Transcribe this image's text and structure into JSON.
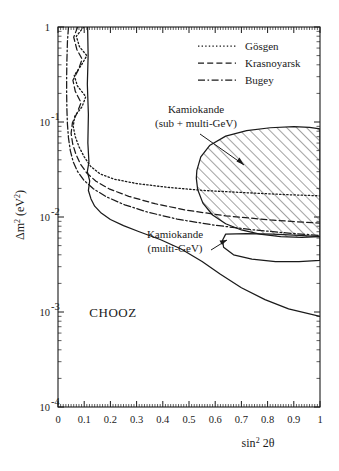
{
  "figure": {
    "background_color": "#ffffff",
    "line_color": "#1a1a1a"
  },
  "chart_data": {
    "type": "line",
    "title": "",
    "xlabel": "sin² 2θ",
    "ylabel": "Δm² (eV²)",
    "xscale": "linear",
    "yscale": "log",
    "xlim": [
      0,
      1
    ],
    "ylim": [
      0.0001,
      1
    ],
    "grid": false,
    "legend_position": "upper-right-inside",
    "xticks": [
      "0",
      "0.1",
      "0.2",
      "0.3",
      "0.4",
      "0.5",
      "0.6",
      "0.7",
      "0.8",
      "0.9",
      "1"
    ],
    "xtick_values": [
      0,
      0.1,
      0.2,
      0.3,
      0.4,
      0.5,
      0.6,
      0.7,
      0.8,
      0.9,
      1
    ],
    "yticks": [
      "1",
      "10 -1",
      "10 -2",
      "10 -3",
      "10 -4"
    ],
    "ytick_values": [
      1,
      0.1,
      0.01,
      0.001,
      0.0001
    ],
    "ytick_mantissa": [
      "1",
      "10",
      "10",
      "10",
      "10"
    ],
    "ytick_exponent": [
      "",
      "-1",
      "-2",
      "-3",
      "-4"
    ],
    "legend": [
      {
        "name": "Gösgen",
        "style": "dotted"
      },
      {
        "name": "Krasnoyarsk",
        "style": "dashed"
      },
      {
        "name": "Bugey",
        "style": "dash-dot"
      }
    ],
    "annotations": [
      {
        "id": "kamiokande-sub-multi",
        "line1": "Kamiokande",
        "line2": "(sub + multi-GeV)",
        "has_arrow": true
      },
      {
        "id": "kamiokande-multi",
        "line1": "Kamiokande",
        "line2": "(multi-GeV)",
        "has_arrow": true
      },
      {
        "id": "chooz",
        "line1": "CHOOZ",
        "line2": "",
        "has_arrow": false
      }
    ],
    "series": [
      {
        "name": "CHOOZ",
        "style": "solid",
        "description": "CHOOZ excluded-region boundary: near-vertical at sin²2θ≈0.115 from Δm²=1 down to ~3e-2, then sweeping right and down to Δm²≈9e-4 at sin²2θ=1",
        "points": [
          [
            0.113,
            1.0
          ],
          [
            0.115,
            0.5
          ],
          [
            0.112,
            0.25
          ],
          [
            0.116,
            0.12
          ],
          [
            0.114,
            0.06
          ],
          [
            0.118,
            0.038
          ],
          [
            0.112,
            0.03
          ],
          [
            0.121,
            0.024
          ],
          [
            0.116,
            0.019
          ],
          [
            0.126,
            0.0155
          ],
          [
            0.14,
            0.013
          ],
          [
            0.165,
            0.011
          ],
          [
            0.2,
            0.0094
          ],
          [
            0.25,
            0.0081
          ],
          [
            0.31,
            0.007
          ],
          [
            0.39,
            0.0058
          ],
          [
            0.47,
            0.0046
          ],
          [
            0.55,
            0.0034
          ],
          [
            0.62,
            0.0025
          ],
          [
            0.7,
            0.0018
          ],
          [
            0.79,
            0.00135
          ],
          [
            0.88,
            0.00108
          ],
          [
            1.0,
            0.0009
          ]
        ]
      },
      {
        "name": "Gösgen",
        "style": "dotted",
        "description": "Reactor exclusion curve, oscillatory above Δm²~0.06, bending right toward sin²2θ=1 near Δm²~2e-2",
        "points": [
          [
            0.098,
            1.0
          ],
          [
            0.07,
            0.8
          ],
          [
            0.082,
            0.62
          ],
          [
            0.11,
            0.5
          ],
          [
            0.09,
            0.4
          ],
          [
            0.062,
            0.31
          ],
          [
            0.074,
            0.24
          ],
          [
            0.106,
            0.185
          ],
          [
            0.092,
            0.145
          ],
          [
            0.064,
            0.115
          ],
          [
            0.058,
            0.09
          ],
          [
            0.066,
            0.07
          ],
          [
            0.08,
            0.055
          ],
          [
            0.1,
            0.043
          ],
          [
            0.125,
            0.034
          ],
          [
            0.16,
            0.0285
          ],
          [
            0.215,
            0.025
          ],
          [
            0.3,
            0.0225
          ],
          [
            0.42,
            0.0205
          ],
          [
            0.56,
            0.019
          ],
          [
            0.72,
            0.018
          ],
          [
            0.87,
            0.0172
          ],
          [
            1.0,
            0.0167
          ]
        ]
      },
      {
        "name": "Krasnoyarsk",
        "style": "dashed",
        "description": "Reactor exclusion curve, oscillatory near top, bending right and dropping below Gösgen at large mixing",
        "points": [
          [
            0.075,
            1.0
          ],
          [
            0.06,
            0.78
          ],
          [
            0.072,
            0.58
          ],
          [
            0.092,
            0.46
          ],
          [
            0.078,
            0.355
          ],
          [
            0.057,
            0.275
          ],
          [
            0.066,
            0.21
          ],
          [
            0.088,
            0.16
          ],
          [
            0.073,
            0.125
          ],
          [
            0.055,
            0.098
          ],
          [
            0.05,
            0.076
          ],
          [
            0.056,
            0.059
          ],
          [
            0.068,
            0.046
          ],
          [
            0.086,
            0.036
          ],
          [
            0.11,
            0.029
          ],
          [
            0.145,
            0.0238
          ],
          [
            0.195,
            0.0198
          ],
          [
            0.27,
            0.0165
          ],
          [
            0.37,
            0.0138
          ],
          [
            0.49,
            0.0118
          ],
          [
            0.64,
            0.0103
          ],
          [
            0.81,
            0.0093
          ],
          [
            1.0,
            0.0086
          ]
        ]
      },
      {
        "name": "Bugey",
        "style": "dash-dot",
        "description": "Reactor exclusion curve, smooth left boundary near sin²2θ~0.03-0.05, bending right to the lowest Δm² at sin²2θ=1",
        "points": [
          [
            0.04,
            1.0
          ],
          [
            0.036,
            0.7
          ],
          [
            0.034,
            0.45
          ],
          [
            0.033,
            0.3
          ],
          [
            0.033,
            0.2
          ],
          [
            0.034,
            0.135
          ],
          [
            0.036,
            0.095
          ],
          [
            0.04,
            0.068
          ],
          [
            0.047,
            0.05
          ],
          [
            0.058,
            0.038
          ],
          [
            0.075,
            0.03
          ],
          [
            0.1,
            0.0242
          ],
          [
            0.135,
            0.0198
          ],
          [
            0.185,
            0.0163
          ],
          [
            0.255,
            0.0134
          ],
          [
            0.345,
            0.0112
          ],
          [
            0.455,
            0.0095
          ],
          [
            0.585,
            0.0083
          ],
          [
            0.73,
            0.0074
          ],
          [
            0.87,
            0.0068
          ],
          [
            1.0,
            0.0064
          ]
        ]
      },
      {
        "name": "Kamiokande (sub + multi-GeV)",
        "style": "solid-hatched",
        "fill": "hatch-45",
        "description": "Allowed region: hatched lobe extending from sin²2θ≈0.52 to the right frame edge, Δm² from ~9e-2 down to ~6e-3",
        "points": [
          [
            0.53,
            0.031
          ],
          [
            0.545,
            0.043
          ],
          [
            0.58,
            0.057
          ],
          [
            0.64,
            0.071
          ],
          [
            0.72,
            0.081
          ],
          [
            0.81,
            0.087
          ],
          [
            0.9,
            0.0895
          ],
          [
            0.96,
            0.088
          ],
          [
            1.0,
            0.0845
          ],
          [
            1.0,
            0.0062
          ],
          [
            0.93,
            0.0061
          ],
          [
            0.85,
            0.0062
          ],
          [
            0.77,
            0.0066
          ],
          [
            0.7,
            0.0073
          ],
          [
            0.64,
            0.0085
          ],
          [
            0.59,
            0.0105
          ],
          [
            0.553,
            0.014
          ],
          [
            0.533,
            0.0195
          ],
          [
            0.528,
            0.0255
          ],
          [
            0.53,
            0.031
          ]
        ]
      },
      {
        "name": "Kamiokande (multi-GeV)",
        "style": "solid",
        "fill": "none",
        "description": "Allowed region: unhatched lobe below the hatched one, sin²2θ from ~0.62 to the right frame edge, Δm² from ~6.5e-3 down to ~3.5e-3",
        "points": [
          [
            0.64,
            0.0066
          ],
          [
            0.72,
            0.0067
          ],
          [
            0.82,
            0.0066
          ],
          [
            0.92,
            0.0064
          ],
          [
            1.0,
            0.0062
          ],
          [
            1.0,
            0.0035
          ],
          [
            0.92,
            0.0034
          ],
          [
            0.83,
            0.0034
          ],
          [
            0.74,
            0.0036
          ],
          [
            0.67,
            0.004
          ],
          [
            0.632,
            0.0048
          ],
          [
            0.628,
            0.0057
          ],
          [
            0.64,
            0.0066
          ]
        ]
      }
    ]
  }
}
